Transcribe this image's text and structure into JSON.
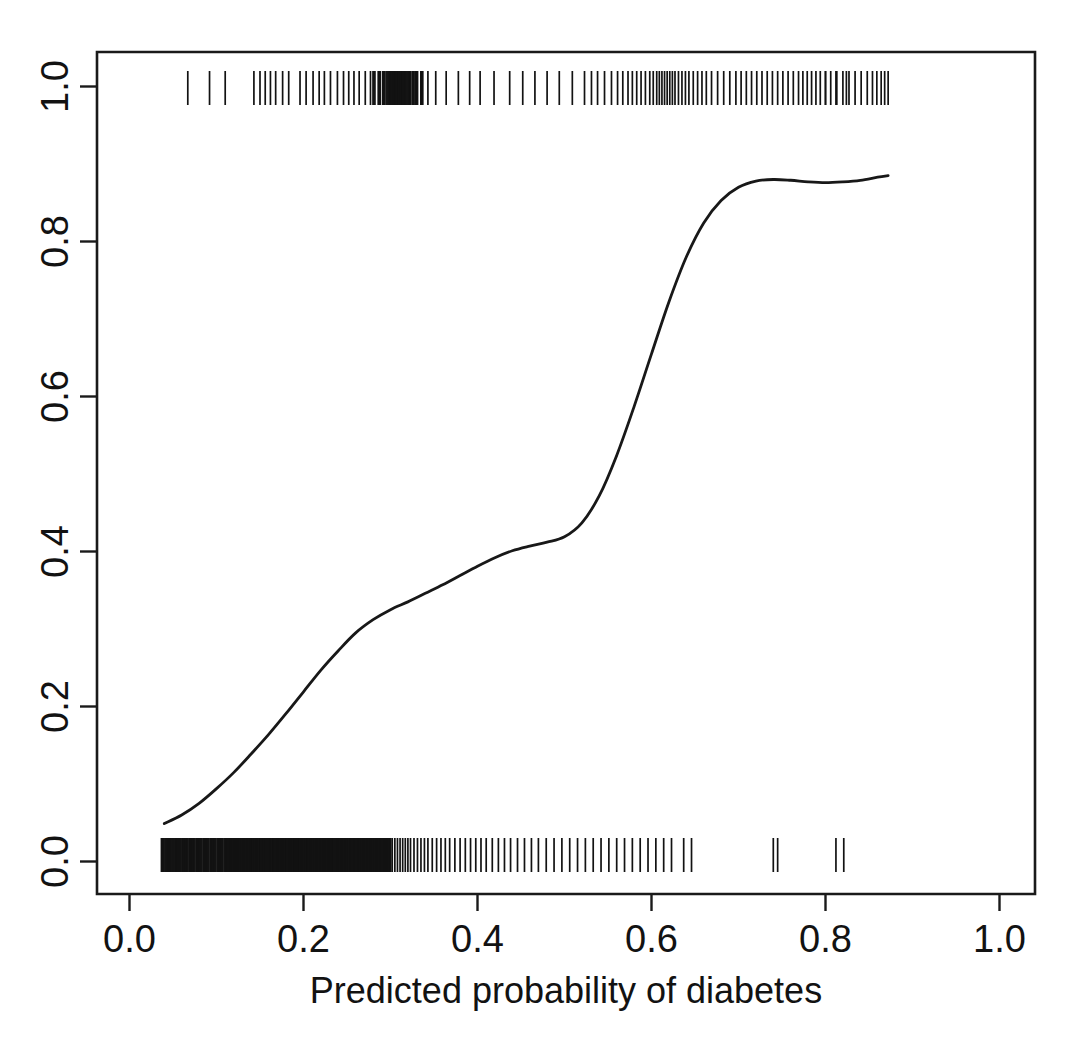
{
  "chart_data": {
    "type": "line",
    "title": "",
    "subtitle": "",
    "xlabel": "Predicted probability of diabetes",
    "ylabel": "",
    "xlim": [
      -0.04,
      1.045
    ],
    "ylim": [
      -0.045,
      1.045
    ],
    "grid": false,
    "legend": null,
    "xticks": [
      0.0,
      0.2,
      0.4,
      0.6,
      0.8,
      1.0
    ],
    "xticklabels": [
      "0.0",
      "0.2",
      "0.4",
      "0.6",
      "0.8",
      "1.0"
    ],
    "yticks": [
      0.0,
      0.2,
      0.4,
      0.6,
      0.8,
      1.0
    ],
    "yticklabels": [
      "0.0",
      "0.2",
      "0.4",
      "0.6",
      "0.8",
      "1.0"
    ],
    "ytick_label_rotation": 90,
    "series": [
      {
        "name": "lowess smooth of observed outcome vs predicted probability",
        "type": "line",
        "x": [
          0.04,
          0.06,
          0.08,
          0.1,
          0.12,
          0.14,
          0.16,
          0.18,
          0.2,
          0.22,
          0.24,
          0.26,
          0.28,
          0.3,
          0.32,
          0.34,
          0.36,
          0.38,
          0.4,
          0.42,
          0.44,
          0.46,
          0.48,
          0.5,
          0.52,
          0.54,
          0.56,
          0.58,
          0.6,
          0.62,
          0.64,
          0.66,
          0.68,
          0.7,
          0.72,
          0.74,
          0.76,
          0.78,
          0.8,
          0.82,
          0.84,
          0.86,
          0.872
        ],
        "y": [
          0.049,
          0.06,
          0.075,
          0.094,
          0.115,
          0.139,
          0.164,
          0.191,
          0.219,
          0.247,
          0.272,
          0.295,
          0.312,
          0.325,
          0.335,
          0.346,
          0.357,
          0.369,
          0.381,
          0.392,
          0.401,
          0.407,
          0.412,
          0.419,
          0.437,
          0.472,
          0.524,
          0.587,
          0.655,
          0.722,
          0.78,
          0.824,
          0.853,
          0.87,
          0.878,
          0.88,
          0.879,
          0.877,
          0.876,
          0.877,
          0.879,
          0.883,
          0.885
        ]
      }
    ],
    "rug_top": {
      "name": "observed diabetes cases (y = 1)",
      "y_value": 1.0,
      "count": 120,
      "values": [
        0.067,
        0.092,
        0.11,
        0.143,
        0.15,
        0.156,
        0.162,
        0.168,
        0.176,
        0.183,
        0.196,
        0.203,
        0.211,
        0.218,
        0.224,
        0.231,
        0.239,
        0.246,
        0.252,
        0.258,
        0.264,
        0.271,
        0.277,
        0.281,
        0.287,
        0.292,
        0.296,
        0.299,
        0.302,
        0.305,
        0.308,
        0.31,
        0.313,
        0.316,
        0.319,
        0.322,
        0.326,
        0.33,
        0.336,
        0.343,
        0.352,
        0.364,
        0.378,
        0.391,
        0.403,
        0.419,
        0.437,
        0.452,
        0.466,
        0.48,
        0.494,
        0.509,
        0.523,
        0.531,
        0.538,
        0.546,
        0.554,
        0.561,
        0.567,
        0.573,
        0.578,
        0.583,
        0.588,
        0.593,
        0.598,
        0.602,
        0.606,
        0.609,
        0.612,
        0.615,
        0.618,
        0.621,
        0.624,
        0.627,
        0.631,
        0.635,
        0.639,
        0.643,
        0.648,
        0.653,
        0.658,
        0.663,
        0.669,
        0.676,
        0.683,
        0.69,
        0.697,
        0.703,
        0.709,
        0.715,
        0.721,
        0.727,
        0.733,
        0.739,
        0.745,
        0.751,
        0.757,
        0.763,
        0.769,
        0.774,
        0.779,
        0.784,
        0.789,
        0.794,
        0.8,
        0.806,
        0.813,
        0.82,
        0.827,
        0.834,
        0.841,
        0.848,
        0.854,
        0.859,
        0.864,
        0.868,
        0.872,
        0.8,
        0.812,
        0.824
      ]
    },
    "rug_bottom": {
      "name": "observed non-cases (y = 0)",
      "y_value": 0.0,
      "count": 230,
      "values": [
        0.038,
        0.042,
        0.046,
        0.05,
        0.054,
        0.058,
        0.062,
        0.066,
        0.07,
        0.074,
        0.078,
        0.082,
        0.086,
        0.09,
        0.094,
        0.098,
        0.102,
        0.106,
        0.11,
        0.113,
        0.116,
        0.119,
        0.122,
        0.125,
        0.128,
        0.131,
        0.134,
        0.137,
        0.14,
        0.143,
        0.146,
        0.149,
        0.152,
        0.155,
        0.158,
        0.161,
        0.164,
        0.167,
        0.17,
        0.173,
        0.176,
        0.179,
        0.182,
        0.185,
        0.188,
        0.191,
        0.194,
        0.197,
        0.2,
        0.203,
        0.206,
        0.209,
        0.212,
        0.215,
        0.218,
        0.221,
        0.224,
        0.227,
        0.23,
        0.233,
        0.236,
        0.239,
        0.242,
        0.245,
        0.248,
        0.251,
        0.254,
        0.257,
        0.26,
        0.263,
        0.266,
        0.269,
        0.272,
        0.275,
        0.278,
        0.281,
        0.284,
        0.287,
        0.29,
        0.293,
        0.296,
        0.299,
        0.302,
        0.305,
        0.308,
        0.311,
        0.314,
        0.317,
        0.32,
        0.323,
        0.327,
        0.331,
        0.335,
        0.339,
        0.343,
        0.348,
        0.353,
        0.358,
        0.363,
        0.368,
        0.374,
        0.38,
        0.386,
        0.392,
        0.398,
        0.404,
        0.41,
        0.417,
        0.424,
        0.431,
        0.438,
        0.446,
        0.454,
        0.462,
        0.47,
        0.479,
        0.488,
        0.497,
        0.506,
        0.515,
        0.524,
        0.533,
        0.542,
        0.551,
        0.56,
        0.569,
        0.578,
        0.587,
        0.596,
        0.605,
        0.614,
        0.623,
        0.637,
        0.646,
        0.74,
        0.745,
        0.812,
        0.821
      ]
    }
  },
  "axes": {
    "x_title": "Predicted probability of diabetes"
  }
}
